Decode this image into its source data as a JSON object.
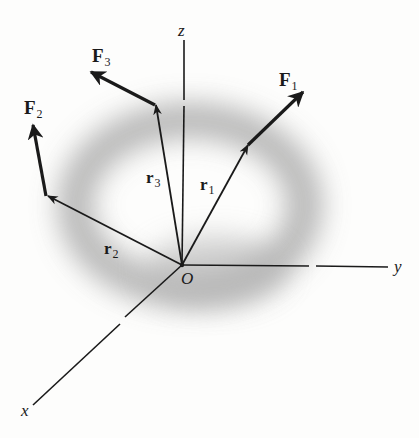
{
  "figure": {
    "type": "3D force vectors about origin",
    "colors": {
      "line": "#1a1a1a",
      "shading": "#9a9a9a",
      "background": "#fdfdfc"
    }
  },
  "axes": {
    "origin_label": "O",
    "x_label": "x",
    "y_label": "y",
    "z_label": "z"
  },
  "position_vectors": [
    {
      "name": "r",
      "sub": "1"
    },
    {
      "name": "r",
      "sub": "2"
    },
    {
      "name": "r",
      "sub": "3"
    }
  ],
  "forces": [
    {
      "name": "F",
      "sub": "1"
    },
    {
      "name": "F",
      "sub": "2"
    },
    {
      "name": "F",
      "sub": "3"
    }
  ]
}
